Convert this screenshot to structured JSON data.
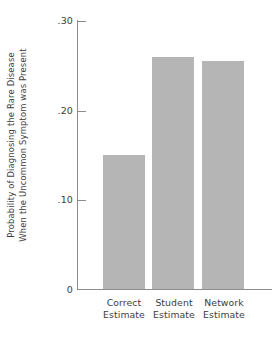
{
  "chart_data": {
    "type": "bar",
    "title": "",
    "subtitle": "",
    "xlabel": "",
    "ylabel": "Probability of Diagnosing the Rare Disease When the Uncommon Symptom was Present",
    "ylabel_lines": [
      "Probability of Diagnosing the Rare Disease",
      "When the Uncommon Symptom was Present"
    ],
    "categories": [
      "Correct Estimate",
      "Student Estimate",
      "Network Estimate"
    ],
    "category_lines": [
      [
        "Correct",
        "Estimate"
      ],
      [
        "Student",
        "Estimate"
      ],
      [
        "Network",
        "Estimate"
      ]
    ],
    "values": [
      0.15,
      0.26,
      0.255
    ],
    "ylim": [
      0,
      0.3
    ],
    "yticks": [
      0,
      0.1,
      0.2,
      0.3
    ],
    "ytick_labels": [
      "0",
      ".10",
      ".20",
      ".30"
    ],
    "grid": false,
    "legend": null,
    "bar_color": "#b5b5b5",
    "axis_color": "#8d8d8d",
    "text_color": "#3d3d3d",
    "background": "#ffffff"
  }
}
